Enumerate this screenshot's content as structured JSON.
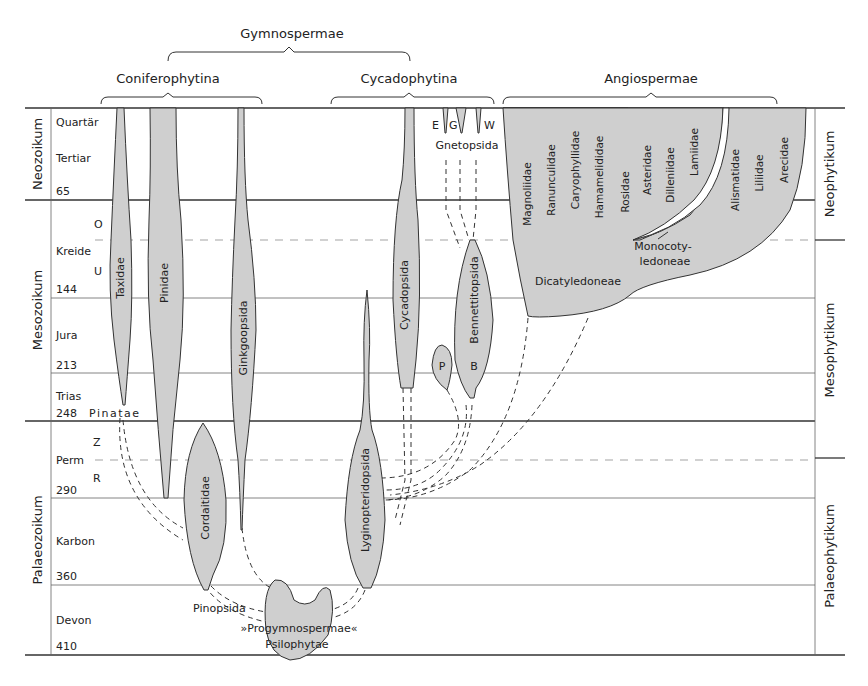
{
  "headers": {
    "gymnospermae": "Gymnospermae",
    "coniferophytina": "Coniferophytina",
    "cycadophytina": "Cycadophytina",
    "angiospermae": "Angiospermae"
  },
  "eras_left": {
    "neozoikum": "Neozoikum",
    "mesozoikum": "Mesozoikum",
    "palaeozoikum": "Palaeozoikum"
  },
  "eras_right": {
    "neophytikum": "Neophytikum",
    "mesophytikum": "Mesophytikum",
    "palaeophytikum": "Palaeophytikum"
  },
  "periods": {
    "quartaer": "Quartär",
    "tertiar": "Tertiar",
    "m65": "65",
    "kreide": "Kreide",
    "kreide_o": "O",
    "kreide_u": "U",
    "m144": "144",
    "jura": "Jura",
    "m213": "213",
    "trias": "Trias",
    "m248": "248",
    "perm": "Perm",
    "perm_z": "Z",
    "perm_r": "R",
    "m290": "290",
    "karbon": "Karbon",
    "m360": "360",
    "devon": "Devon",
    "m410": "410"
  },
  "taxa": {
    "taxidae": "Taxidae",
    "pinidae": "Pinidae",
    "ginkgoopsida": "Ginkgoopsida",
    "pinatae": "Pinatae",
    "cordaitidae": "Cordaitidae",
    "pinopsida": "Pinopsida",
    "progymnospermae": "»Progymnospermae«",
    "psilophytae": "Psilophytae",
    "lyginopteridopsida": "Lyginopteridopsida",
    "cycadopsida": "Cycadopsida",
    "bennettitopsida": "Bennettitopsida",
    "p": "P",
    "b": "B",
    "gnetopsida": "Gnetopsida",
    "e": "E",
    "g": "G",
    "w": "W",
    "magnoliidae": "Magnoliidae",
    "ranunculidae": "Ranunculidae",
    "caryophyllidae": "Caryophyllidae",
    "hamamelididae": "Hamamelididae",
    "rosidae": "Rosidae",
    "asteridae": "Asteridae",
    "dilleniidae": "Dilleniidae",
    "lamiidae": "Lamiidae",
    "alismatidae": "Alismatidae",
    "liliidae": "Liliidae",
    "arecidae": "Arecidae",
    "monocotyledoneae_1": "Monocoty-",
    "monocotyledoneae_2": "ledoneae",
    "dicatyledoneae": "Dicatyledoneae"
  },
  "colors": {
    "fill": "#cfcfcf",
    "line": "#333333",
    "grid_dash": "#999999"
  }
}
